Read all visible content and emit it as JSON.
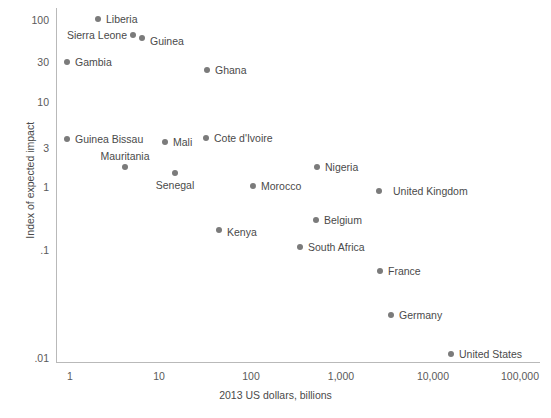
{
  "chart_data": {
    "type": "scatter",
    "title": "",
    "xlabel": "2013 US dollars, billions",
    "ylabel": "Index of expected impact",
    "xscale": "log",
    "yscale": "log",
    "xlim": [
      1,
      100000
    ],
    "ylim": [
      0.01,
      100
    ],
    "xticks": [
      "1",
      "10",
      "100",
      "1,000",
      "10,000",
      "100,000"
    ],
    "yticks": [
      "100",
      "30",
      "10",
      "3",
      "1",
      ".1",
      ".01"
    ],
    "grid": false,
    "legend": "none",
    "point_color": "#7b7b7b",
    "axis_color": "#b9b9b9",
    "text_color": "#4a4a4a",
    "points": [
      {
        "name": "Liberia",
        "x": 2.0,
        "y": 100,
        "px": 98,
        "py": 19,
        "lx": 106,
        "ly": 19,
        "side": "right"
      },
      {
        "name": "Sierra Leone",
        "x": 4.9,
        "y": 62,
        "px": 133,
        "py": 35,
        "lx": 127,
        "ly": 35,
        "side": "left"
      },
      {
        "name": "Guinea",
        "x": 6.6,
        "y": 56,
        "px": 142,
        "py": 38,
        "lx": 150,
        "ly": 41,
        "side": "right"
      },
      {
        "name": "Gambia",
        "x": 0.9,
        "y": 30,
        "px": 67,
        "py": 62,
        "lx": 75,
        "ly": 62,
        "side": "right"
      },
      {
        "name": "Ghana",
        "x": 45,
        "y": 23,
        "px": 207,
        "py": 70,
        "lx": 215,
        "ly": 70,
        "side": "right"
      },
      {
        "name": "Guinea Bissau",
        "x": 1.0,
        "y": 3.6,
        "px": 67,
        "py": 139,
        "lx": 75,
        "ly": 139,
        "side": "right"
      },
      {
        "name": "Cote d'Ivoire",
        "x": 40,
        "y": 3.7,
        "px": 206,
        "py": 138,
        "lx": 214,
        "ly": 138,
        "side": "right"
      },
      {
        "name": "Mali",
        "x": 13,
        "y": 3.2,
        "px": 165,
        "py": 142,
        "lx": 173,
        "ly": 142,
        "side": "right"
      },
      {
        "name": "Mauritania",
        "x": 4.2,
        "y": 1.8,
        "px": 125,
        "py": 167,
        "lx": 125,
        "ly": 156,
        "side": "center"
      },
      {
        "name": "Senegal",
        "x": 16,
        "y": 1.5,
        "px": 175,
        "py": 173,
        "lx": 175,
        "ly": 185,
        "side": "center"
      },
      {
        "name": "Morocco",
        "x": 105,
        "y": 1.05,
        "px": 253,
        "py": 186,
        "lx": 261,
        "ly": 186,
        "side": "right"
      },
      {
        "name": "Nigeria",
        "x": 520,
        "y": 1.85,
        "px": 317,
        "py": 167,
        "lx": 325,
        "ly": 167,
        "side": "right"
      },
      {
        "name": "United Kingdom",
        "x": 2600,
        "y": 0.95,
        "px": 379,
        "py": 191,
        "lx": 393,
        "ly": 191,
        "side": "right"
      },
      {
        "name": "Belgium",
        "x": 510,
        "y": 0.42,
        "px": 316,
        "py": 220,
        "lx": 324,
        "ly": 220,
        "side": "right"
      },
      {
        "name": "Kenya",
        "x": 55,
        "y": 0.3,
        "px": 219,
        "py": 230,
        "lx": 227,
        "ly": 232,
        "side": "right"
      },
      {
        "name": "South Africa",
        "x": 350,
        "y": 0.2,
        "px": 300,
        "py": 247,
        "lx": 308,
        "ly": 247,
        "side": "right"
      },
      {
        "name": "France",
        "x": 2700,
        "y": 0.095,
        "px": 380,
        "py": 271,
        "lx": 388,
        "ly": 271,
        "side": "right"
      },
      {
        "name": "Germany",
        "x": 3600,
        "y": 0.028,
        "px": 391,
        "py": 315,
        "lx": 399,
        "ly": 315,
        "side": "right"
      },
      {
        "name": "United States",
        "x": 16500,
        "y": 0.01,
        "px": 451,
        "py": 354,
        "lx": 459,
        "ly": 354,
        "side": "right"
      }
    ],
    "x_tick_positions": [
      70,
      159,
      251,
      341,
      433,
      520
    ],
    "y_tick_positions": [
      20,
      62,
      102,
      148,
      187,
      250,
      358
    ]
  }
}
